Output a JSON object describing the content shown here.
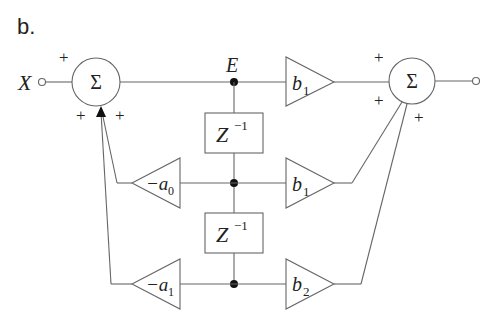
{
  "figure_label": "b.",
  "input": {
    "label": "X"
  },
  "node": {
    "label": "E"
  },
  "summers": [
    {
      "id": "input-summer",
      "symbol": "Σ",
      "signs": [
        "+",
        "+",
        "+"
      ]
    },
    {
      "id": "output-summer",
      "symbol": "Σ",
      "signs": [
        "+",
        "+",
        "+"
      ]
    }
  ],
  "delays": [
    {
      "base": "Z",
      "exp": "−1"
    },
    {
      "base": "Z",
      "exp": "−1"
    }
  ],
  "feedback_gains": [
    {
      "prefix": "−a",
      "sub": "0"
    },
    {
      "prefix": "−a",
      "sub": "1"
    }
  ],
  "feedforward_gains": [
    {
      "prefix": "b",
      "sub": "1"
    },
    {
      "prefix": "b",
      "sub": "1"
    },
    {
      "prefix": "b",
      "sub": "2"
    }
  ]
}
